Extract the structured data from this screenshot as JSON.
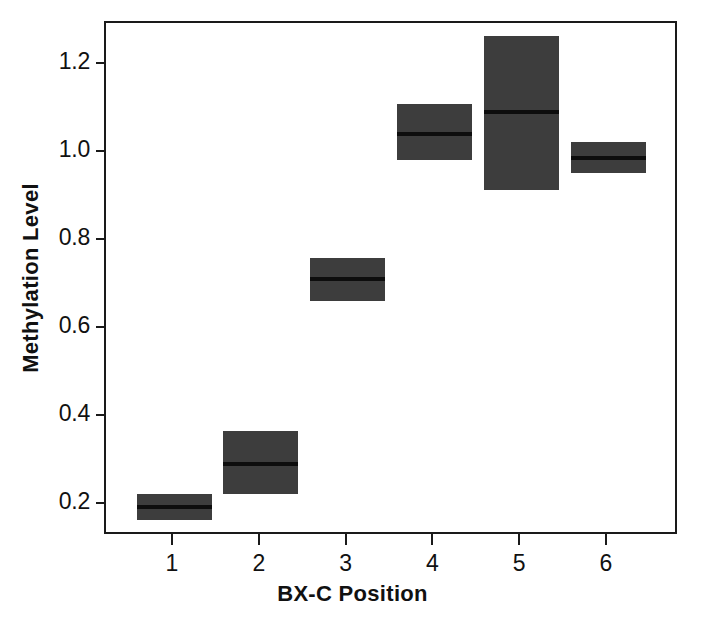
{
  "chart_data": {
    "type": "bar",
    "title": "",
    "subtitle": "",
    "xlabel": "BX-C Position",
    "ylabel": "Methylation Level",
    "categories": [
      "1",
      "2",
      "3",
      "4",
      "5",
      "6"
    ],
    "xticklabels": [
      "1",
      "2",
      "3",
      "4",
      "5",
      "6"
    ],
    "yticklabels": [
      "0.2",
      "0.4",
      "0.6",
      "0.8",
      "1.0",
      "1.2"
    ],
    "ytickvalues": [
      0.2,
      0.4,
      0.6,
      0.8,
      1.0,
      1.2
    ],
    "xlim": [
      0.5,
      6.5
    ],
    "ylim": [
      0.1,
      1.3
    ],
    "grid": false,
    "legend": false,
    "legend_position": "none",
    "box_color": "#3d3d3d",
    "median_color": "#0d0d0d",
    "axis_color": "#1a1a1a",
    "background_color": "#ffffff",
    "series": [
      {
        "name": "Methylation Level",
        "values": [
          0.196,
          0.293,
          0.714,
          1.043,
          1.093,
          0.989
        ],
        "upper": [
          0.225,
          0.368,
          0.761,
          1.111,
          1.266,
          1.025
        ],
        "lower": [
          0.166,
          0.225,
          0.664,
          0.984,
          0.916,
          0.955
        ]
      }
    ],
    "points": [
      {
        "x": "1",
        "median": 0.196,
        "upper": 0.225,
        "lower": 0.166
      },
      {
        "x": "2",
        "median": 0.293,
        "upper": 0.368,
        "lower": 0.225
      },
      {
        "x": "3",
        "median": 0.714,
        "upper": 0.761,
        "lower": 0.664
      },
      {
        "x": "4",
        "median": 1.043,
        "upper": 1.111,
        "lower": 0.984
      },
      {
        "x": "5",
        "median": 1.093,
        "upper": 1.266,
        "lower": 0.916
      },
      {
        "x": "6",
        "median": 0.989,
        "upper": 1.025,
        "lower": 0.955
      }
    ]
  }
}
